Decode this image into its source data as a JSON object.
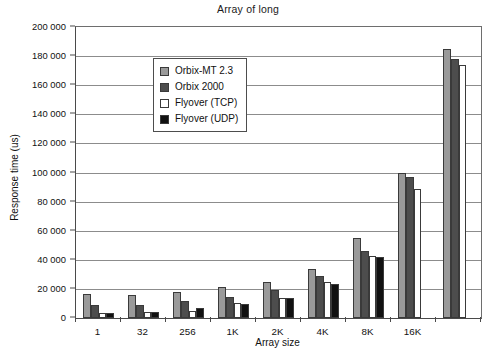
{
  "chart_data": {
    "type": "bar",
    "title": "Array of long",
    "xlabel": "Array size",
    "ylabel": "Response time (us)",
    "ylim": [
      0,
      200000
    ],
    "ytick_step": 20000,
    "grid": true,
    "legend_position": "top-left-inside",
    "categories": [
      "1",
      "32",
      "256",
      "1K",
      "2K",
      "4K",
      "8K",
      "16K",
      ""
    ],
    "series": [
      {
        "name": "Orbix-MT 2.3",
        "color": "#9a9a9a",
        "values": [
          16500,
          16000,
          18000,
          21500,
          25000,
          34000,
          55000,
          100000,
          185000
        ]
      },
      {
        "name": "Orbix 2000",
        "color": "#4d4d4d",
        "values": [
          9000,
          9000,
          11500,
          14500,
          19500,
          29000,
          46000,
          97000,
          178000
        ]
      },
      {
        "name": "Flyover (TCP)",
        "color": "#ffffff",
        "values": [
          3500,
          4000,
          5000,
          10500,
          13500,
          24500,
          42500,
          89000,
          174000
        ]
      },
      {
        "name": "Flyover (UDP)",
        "color": "#111111",
        "values": [
          3500,
          4000,
          7000,
          9500,
          14000,
          23500,
          42000,
          null,
          null
        ]
      }
    ],
    "ytick_labels": [
      "0",
      "20 000",
      "40 000",
      "60 000",
      "80 000",
      "100 000",
      "120 000",
      "140 000",
      "160 000",
      "180 000",
      "200 000"
    ]
  }
}
